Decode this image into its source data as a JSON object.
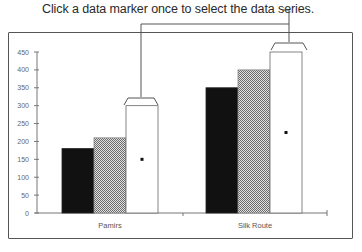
{
  "callout": {
    "text": "Click a data marker once to select the data series."
  },
  "chart_data": {
    "type": "bar",
    "title": "",
    "xlabel": "",
    "ylabel": "",
    "categories": [
      "Pamirs",
      "Silk Route"
    ],
    "series": [
      {
        "name": "Series 1",
        "fill": "solid-black",
        "values": [
          180,
          350
        ]
      },
      {
        "name": "Series 2",
        "fill": "gray-crosshatch",
        "values": [
          210,
          400
        ]
      },
      {
        "name": "Series 3",
        "fill": "white",
        "selected": true,
        "values": [
          300,
          450
        ]
      }
    ],
    "yticks": [
      0,
      50,
      100,
      150,
      200,
      250,
      300,
      350,
      400,
      450
    ],
    "ylim": [
      0,
      450
    ],
    "grid": false,
    "legend": "none",
    "annotations": [
      {
        "text": "Click a data marker once to select the data series.",
        "target": "Series 3"
      }
    ]
  },
  "axis": {
    "ticks": [
      "0",
      "50",
      "100",
      "150",
      "200",
      "250",
      "300",
      "350",
      "400",
      "450"
    ],
    "categories": [
      "Pamirs",
      "Silk Route"
    ]
  }
}
